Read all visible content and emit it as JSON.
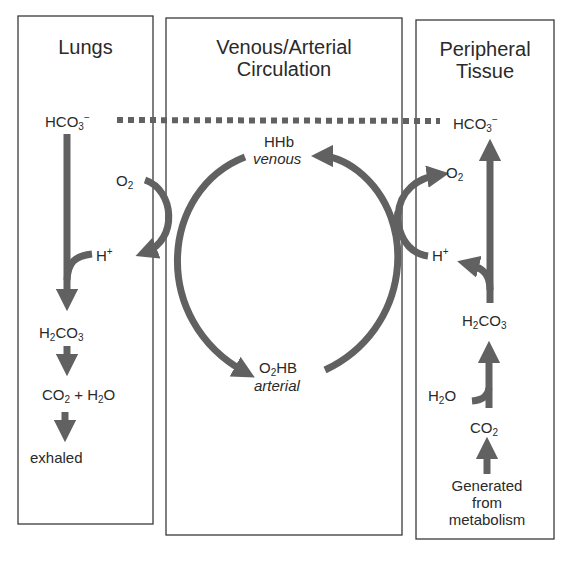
{
  "panels": [
    {
      "id": "lungs",
      "title": "Lungs"
    },
    {
      "id": "circulation",
      "title_line1": "Venous/Arterial",
      "title_line2": "Circulation"
    },
    {
      "id": "tissue",
      "title_line1": "Peripheral",
      "title_line2": "Tissue"
    }
  ],
  "lungs": {
    "bicarbonate": {
      "base": "HCO",
      "sub": "3",
      "sup": "−"
    },
    "oxygen": {
      "base": "O",
      "sub": "2"
    },
    "proton": {
      "base": "H",
      "sup": "+"
    },
    "carbonic_acid": {
      "a": "H",
      "sub1": "2",
      "b": "CO",
      "sub2": "3"
    },
    "products": {
      "a": "CO",
      "sub1": "2",
      "plus": " + H",
      "sub2": "2",
      "b": "O"
    },
    "exhaled": "exhaled"
  },
  "circulation": {
    "venous": {
      "species": "HHb",
      "state": "venous"
    },
    "arterial": {
      "species_a": "O",
      "sub": "2",
      "species_b": "HB",
      "state": "arterial"
    }
  },
  "tissue": {
    "bicarbonate": {
      "base": "HCO",
      "sub": "3",
      "sup": "−"
    },
    "oxygen": {
      "base": "O",
      "sub": "2"
    },
    "proton": {
      "base": "H",
      "sup": "+"
    },
    "carbonic_acid": {
      "a": "H",
      "sub1": "2",
      "b": "CO",
      "sub2": "3"
    },
    "water": {
      "a": "H",
      "sub": "2",
      "b": "O"
    },
    "co2": {
      "a": "CO",
      "sub": "2"
    },
    "source_line1": "Generated",
    "source_line2": "from",
    "source_line3": "metabolism"
  },
  "colors": {
    "arrow": "#616161",
    "border": "#3a3a3a",
    "text": "#2a2a2a"
  }
}
